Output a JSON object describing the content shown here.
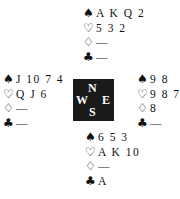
{
  "symbols": {
    "spades": "♠",
    "hearts": "♡",
    "diamonds": "♢",
    "clubs": "♣"
  },
  "hands": {
    "north": {
      "spades": "A K Q 2",
      "hearts": "5 3 2",
      "diamonds": "—",
      "clubs": "—"
    },
    "west": {
      "spades": "J 10 7 4",
      "hearts": "Q J 6",
      "diamonds": "—",
      "clubs": "—"
    },
    "east": {
      "spades": "9 8",
      "hearts": "9 8 7 4",
      "diamonds": "8",
      "clubs": "—"
    },
    "south": {
      "spades": "6 5 3",
      "hearts": "A K 10",
      "diamonds": "—",
      "clubs": "A"
    }
  },
  "compass": {
    "n": "N",
    "w": "W",
    "e": "E",
    "s": "S"
  }
}
